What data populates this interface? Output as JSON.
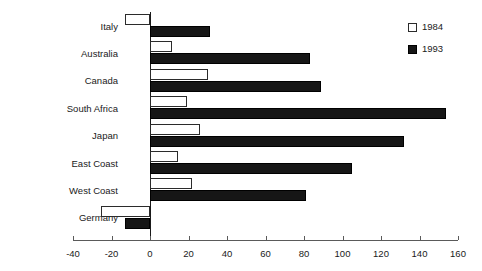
{
  "chart_data": {
    "type": "bar",
    "orientation": "horizontal",
    "title": "",
    "xlabel": "",
    "ylabel": "",
    "categories": [
      "Italy",
      "Australia",
      "Canada",
      "South Africa",
      "Japan",
      "East Coast",
      "West Coast",
      "Germany"
    ],
    "series": [
      {
        "name": "1984",
        "color": "#ffffff",
        "values": [
          -13,
          11.5,
          30,
          19,
          26,
          14.5,
          22,
          -25.5
        ]
      },
      {
        "name": "1993",
        "color": "#161616",
        "values": [
          31,
          83,
          89,
          154,
          132,
          105,
          81,
          -13
        ]
      }
    ],
    "xlim": [
      -40,
      160
    ],
    "xticks": [
      -40,
      -20,
      0,
      20,
      40,
      60,
      80,
      100,
      120,
      140,
      160
    ],
    "xtick_labels": [
      "-40",
      "-20",
      "0",
      "20",
      "40",
      "60",
      "80",
      "100",
      "120",
      "140",
      "160"
    ],
    "grid": false,
    "legend": {
      "position": "top-right",
      "entries": [
        "1984",
        "1993"
      ]
    }
  },
  "legend": {
    "entries": [
      {
        "label": "1984",
        "swatch": "white-square-outline-icon"
      },
      {
        "label": "1993",
        "swatch": "black-square-icon"
      }
    ]
  }
}
